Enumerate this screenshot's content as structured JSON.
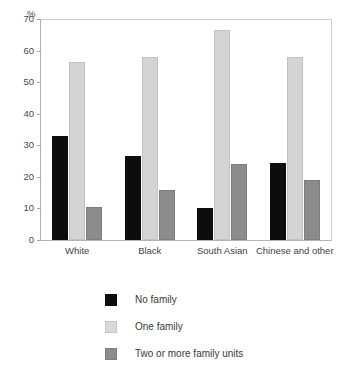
{
  "chart_data": {
    "type": "bar",
    "title": "",
    "subtitle": "",
    "xlabel": "",
    "ylabel": "%",
    "ylim": [
      0,
      70
    ],
    "yticks": [
      0,
      10,
      20,
      30,
      40,
      50,
      60,
      70
    ],
    "ytick_labels": [
      "0",
      "10",
      "20",
      "30",
      "40",
      "50",
      "60",
      "70"
    ],
    "grid": false,
    "legend_position": "bottom",
    "categories": [
      "White",
      "Black",
      "South Asian",
      "Chinese and other"
    ],
    "series": [
      {
        "name": "No family",
        "color": "#0d0d0d",
        "values": [
          33,
          26.5,
          10,
          24.5
        ]
      },
      {
        "name": "One family",
        "color": "#d9d9d9",
        "values": [
          56.5,
          58,
          66.5,
          58
        ]
      },
      {
        "name": "Two or more family units",
        "color": "#8c8c8c",
        "values": [
          10.5,
          15.7,
          24,
          19
        ]
      }
    ]
  },
  "axis": {
    "unit_label": "%"
  },
  "legend": {
    "items": [
      {
        "label": "No family"
      },
      {
        "label": "One family"
      },
      {
        "label": "Two or more family units"
      }
    ]
  }
}
